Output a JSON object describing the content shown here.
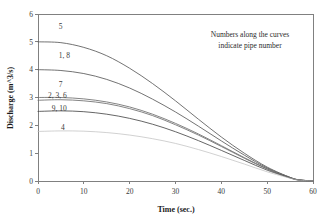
{
  "chart_data": {
    "type": "line",
    "title": "",
    "xlabel": "Time (sec.)",
    "ylabel": "Discharge (m^3/s)",
    "xlim": [
      0,
      60
    ],
    "ylim": [
      0,
      6
    ],
    "xticks": [
      "0",
      "10",
      "20",
      "30",
      "40",
      "50",
      "60"
    ],
    "yticks": [
      "0",
      "1",
      "2",
      "3",
      "4",
      "5",
      "6"
    ],
    "grid": false,
    "legend": "none",
    "annotations": [
      "Numbers along the curves",
      "indicate pipe number"
    ],
    "series": [
      {
        "name": "5",
        "label": "5",
        "color": "#5a5a5a",
        "x": [
          0,
          5,
          10,
          15,
          20,
          25,
          30,
          35,
          40,
          45,
          50,
          55,
          57,
          60
        ],
        "y": [
          5.0,
          4.97,
          4.8,
          4.5,
          4.05,
          3.5,
          2.88,
          2.22,
          1.58,
          1.0,
          0.5,
          0.13,
          0.04,
          0.0
        ]
      },
      {
        "name": "1, 8",
        "label": "1, 8",
        "color": "#5a5a5a",
        "x": [
          0,
          5,
          10,
          15,
          20,
          25,
          30,
          35,
          40,
          45,
          50,
          55,
          57,
          60
        ],
        "y": [
          4.0,
          3.97,
          3.86,
          3.65,
          3.34,
          2.94,
          2.48,
          1.97,
          1.44,
          0.93,
          0.47,
          0.13,
          0.04,
          0.0
        ]
      },
      {
        "name": "7",
        "label": "7",
        "color": "#6e6e6e",
        "x": [
          0,
          5,
          10,
          15,
          20,
          25,
          30,
          35,
          40,
          45,
          50,
          55,
          57,
          60
        ],
        "y": [
          3.0,
          3.0,
          2.95,
          2.84,
          2.66,
          2.4,
          2.07,
          1.69,
          1.27,
          0.84,
          0.44,
          0.12,
          0.04,
          0.0
        ]
      },
      {
        "name": "2, 3, 6",
        "label": "2, 3, 6",
        "color": "#6e6e6e",
        "x": [
          0,
          5,
          10,
          15,
          20,
          25,
          30,
          35,
          40,
          45,
          50,
          55,
          57,
          60
        ],
        "y": [
          2.9,
          2.92,
          2.88,
          2.78,
          2.6,
          2.35,
          2.02,
          1.65,
          1.24,
          0.82,
          0.43,
          0.12,
          0.04,
          0.0
        ]
      },
      {
        "name": "9, 10",
        "label": "9, 10",
        "color": "#4a4a4a",
        "x": [
          0,
          5,
          10,
          15,
          20,
          25,
          30,
          35,
          40,
          45,
          50,
          55,
          57,
          60
        ],
        "y": [
          2.5,
          2.52,
          2.49,
          2.4,
          2.25,
          2.04,
          1.77,
          1.45,
          1.1,
          0.74,
          0.39,
          0.11,
          0.03,
          0.0
        ]
      },
      {
        "name": "4",
        "label": "4",
        "color": "#bdbdbd",
        "x": [
          0,
          5,
          10,
          15,
          20,
          25,
          30,
          35,
          40,
          45,
          50,
          55,
          57,
          60
        ],
        "y": [
          1.78,
          1.8,
          1.79,
          1.74,
          1.65,
          1.52,
          1.35,
          1.13,
          0.88,
          0.61,
          0.33,
          0.1,
          0.03,
          0.0
        ]
      }
    ],
    "curve_labels": [
      {
        "text": "5",
        "x": 4.5,
        "y": 5.45
      },
      {
        "text": "1, 8",
        "x": 4.5,
        "y": 4.42
      },
      {
        "text": "7",
        "x": 4.5,
        "y": 3.38
      },
      {
        "text": "2, 3, 6",
        "x": 2.2,
        "y": 2.98
      },
      {
        "text": "9, 10",
        "x": 3.0,
        "y": 2.52
      },
      {
        "text": "4",
        "x": 5.0,
        "y": 1.82
      }
    ]
  }
}
